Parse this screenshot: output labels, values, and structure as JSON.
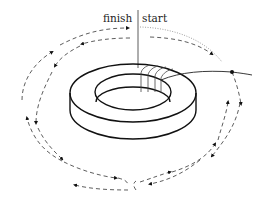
{
  "diagram": {
    "labels": {
      "finish": "finish",
      "start": "start"
    },
    "colors": {
      "stroke": "#111111",
      "dashed": "#333333",
      "dotted": "#777777",
      "background": "#ffffff"
    },
    "elements": [
      {
        "id": "toroid-core",
        "kind": "ring",
        "description": "toroidal core drawn in perspective"
      },
      {
        "id": "winding",
        "kind": "wire-turns",
        "count": 4
      },
      {
        "id": "lead-wire",
        "kind": "wire",
        "description": "lead leaving winding to the right"
      },
      {
        "id": "junction-dot",
        "kind": "dot"
      },
      {
        "id": "outer-field-loop",
        "kind": "dashed-loop-with-arrows"
      },
      {
        "id": "inner-field-loop",
        "kind": "dashed-loop-with-arrows"
      },
      {
        "id": "start-path",
        "kind": "dotted-path"
      },
      {
        "id": "axis-line",
        "kind": "vertical-line"
      }
    ]
  }
}
